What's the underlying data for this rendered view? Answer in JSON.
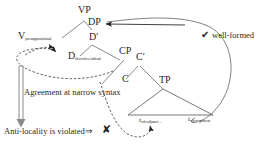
{
  "figure": {
    "type": "syntactic-tree-diagram",
    "background_color": "#ffffff",
    "line_color": "#555555",
    "text_color": "#1f1f1f"
  },
  "tree": {
    "nodes": [
      {
        "id": "VP",
        "label": "VP",
        "subscript": "",
        "x": 78,
        "y": 10
      },
      {
        "id": "V",
        "label": "V",
        "subscript": "presuppositional",
        "x": 18,
        "y": 36
      },
      {
        "id": "DP",
        "label": "DP",
        "subscript": "",
        "x": 88,
        "y": 22
      },
      {
        "id": "Dbar",
        "label": "D′",
        "subscript": "",
        "x": 89,
        "y": 37
      },
      {
        "id": "D",
        "label": "D",
        "subscript": "defective/affixal",
        "x": 68,
        "y": 56
      },
      {
        "id": "CP",
        "label": "CP",
        "subscript": "",
        "x": 119,
        "y": 51
      },
      {
        "id": "Cbar",
        "label": "C′",
        "subscript": "",
        "x": 136,
        "y": 57
      },
      {
        "id": "C",
        "label": "C",
        "subscript": "",
        "x": 122,
        "y": 79
      },
      {
        "id": "TP",
        "label": "TP",
        "subscript": "",
        "x": 159,
        "y": 80
      }
    ],
    "traces": [
      {
        "id": "t-wh-adjunct",
        "label": "t",
        "subscript": "wh-adjunct…",
        "x": 139,
        "y": 121
      },
      {
        "id": "t-wh-argument",
        "label": "t",
        "subscript": "wh-argument",
        "x": 188,
        "y": 120
      }
    ]
  },
  "annotations": {
    "agreement": {
      "text": "Agreement at narrow syntax",
      "x": 24,
      "y": 92
    },
    "anti_locality": {
      "text": "Anti-locality is violated⇒",
      "x": 4,
      "y": 131
    },
    "well_formed": {
      "text": "well-formed",
      "x": 211,
      "y": 35
    }
  },
  "marks": {
    "check": {
      "glyph": "✔",
      "x": 201,
      "y": 34,
      "meaning": "well-formed-check"
    },
    "cross": {
      "glyph": "✘",
      "x": 102,
      "y": 128,
      "meaning": "ill-formed-cross"
    }
  }
}
